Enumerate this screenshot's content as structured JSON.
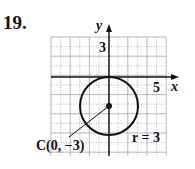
{
  "problem": {
    "number": "19."
  },
  "graph": {
    "x_axis_label": "x",
    "y_axis_label": "y",
    "x_tick_label": "5",
    "y_tick_label": "3",
    "x_range": [
      -6,
      6
    ],
    "y_range": [
      -8,
      4
    ],
    "grid": true
  },
  "circle": {
    "center": {
      "x": 0,
      "y": -3
    },
    "radius": 3,
    "center_label": "C(0, −3)",
    "radius_label": "r = 3"
  },
  "colors": {
    "stroke": "#111111",
    "grid": "#9a9a9a",
    "background": "#ffffff"
  }
}
